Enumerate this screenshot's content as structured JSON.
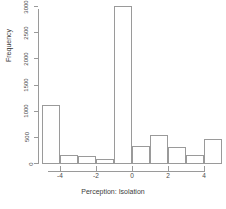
{
  "chart_data": {
    "type": "bar",
    "title": "",
    "subtitle": "",
    "xlabel": "Perception: Isolation",
    "ylabel": "Frequency",
    "xlim": [
      -5,
      5
    ],
    "ylim": [
      0,
      3000
    ],
    "grid": false,
    "legend": null,
    "bin_width": 1,
    "bin_edges": [
      -5,
      -4,
      -3,
      -2,
      -1,
      0,
      1,
      2,
      3,
      4,
      5
    ],
    "categories": [
      "-5 to -4",
      "-4 to -3",
      "-3 to -2",
      "-2 to -1",
      "-1 to 0",
      "0 to 1",
      "1 to 2",
      "2 to 3",
      "3 to 4",
      "4 to 5"
    ],
    "values": [
      1100,
      150,
      140,
      80,
      3000,
      320,
      530,
      300,
      150,
      450
    ],
    "x_ticks": [
      -4,
      -2,
      0,
      2,
      4
    ],
    "x_tick_labels": [
      "-4",
      "-2",
      "0",
      "2",
      "4"
    ],
    "y_ticks": [
      0,
      500,
      1000,
      1500,
      2000,
      2500,
      3000
    ],
    "y_tick_labels": [
      "0",
      "500",
      "1000",
      "1500",
      "2000",
      "2500",
      "3000"
    ],
    "colors": {
      "bar_border": "#9a9a9a",
      "bar_fill": "transparent",
      "axis": "#9a9a9a",
      "text": "#3d3d3d",
      "background": "#ffffff"
    }
  }
}
